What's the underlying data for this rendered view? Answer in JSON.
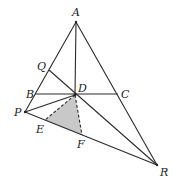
{
  "diagram": {
    "points": {
      "A": {
        "x": 76,
        "y": 22
      },
      "Q": {
        "x": 49,
        "y": 70
      },
      "B": {
        "x": 35,
        "y": 94
      },
      "D": {
        "x": 75,
        "y": 95
      },
      "C": {
        "x": 118,
        "y": 94
      },
      "P": {
        "x": 25,
        "y": 112
      },
      "E": {
        "x": 45,
        "y": 120
      },
      "F": {
        "x": 82,
        "y": 135
      },
      "R": {
        "x": 157,
        "y": 165
      }
    },
    "labels": {
      "A": "A",
      "Q": "Q",
      "B": "B",
      "D": "D",
      "C": "C",
      "P": "P",
      "E": "E",
      "F": "F",
      "R": "R"
    },
    "shaded_region": [
      "D",
      "E",
      "F"
    ],
    "shade_color": "#c8c8c8",
    "line_color": "#2a2a2a"
  }
}
